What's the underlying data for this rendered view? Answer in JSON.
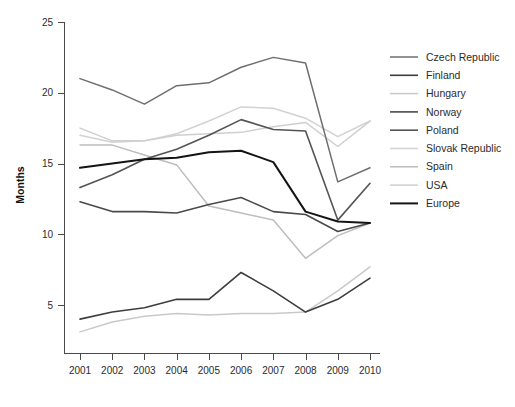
{
  "chart_data": {
    "type": "line",
    "title": "",
    "xlabel": "",
    "ylabel": "Months",
    "x": [
      2001,
      2002,
      2003,
      2004,
      2005,
      2006,
      2007,
      2008,
      2009,
      2010
    ],
    "xtick_labels": [
      "2001",
      "2002",
      "2003",
      "2004",
      "2005",
      "2006",
      "2007",
      "2008",
      "2009",
      "2010"
    ],
    "ytick_labels": [
      "5",
      "10",
      "15",
      "20",
      "25"
    ],
    "yticks": [
      5,
      10,
      15,
      20,
      25
    ],
    "ylim": [
      2.2,
      25
    ],
    "xlim": [
      2001,
      2010
    ],
    "grid": false,
    "legend_position": "right",
    "series": [
      {
        "name": "Czech Republic",
        "color": "#6e6e6e",
        "width": 1.5,
        "values": [
          21.0,
          20.2,
          19.2,
          20.5,
          20.7,
          21.8,
          22.5,
          22.1,
          13.7,
          14.7
        ]
      },
      {
        "name": "Finland",
        "color": "#3d3d3d",
        "width": 1.6,
        "values": [
          4.0,
          4.5,
          4.8,
          5.4,
          5.4,
          7.3,
          6.0,
          4.5,
          5.4,
          6.9
        ]
      },
      {
        "name": "Hungary",
        "color": "#c9c9c9",
        "width": 1.5,
        "values": [
          3.1,
          3.8,
          4.2,
          4.4,
          4.3,
          4.4,
          4.4,
          4.5,
          6.0,
          7.7
        ]
      },
      {
        "name": "Norway",
        "color": "#4a4a4a",
        "width": 1.6,
        "values": [
          12.3,
          11.6,
          11.6,
          11.5,
          12.1,
          12.6,
          11.6,
          11.4,
          10.2,
          10.8
        ]
      },
      {
        "name": "Poland",
        "color": "#545454",
        "width": 1.6,
        "values": [
          13.3,
          14.2,
          15.3,
          16.0,
          17.0,
          18.1,
          17.4,
          17.3,
          11.0,
          13.6
        ]
      },
      {
        "name": "Slovak Republic",
        "color": "#d2d2d2",
        "width": 1.5,
        "values": [
          17.0,
          16.5,
          16.6,
          17.1,
          18.0,
          19.0,
          18.9,
          18.2,
          16.9,
          18.0
        ]
      },
      {
        "name": "Spain",
        "color": "#bdbdbd",
        "width": 1.5,
        "values": [
          16.3,
          16.3,
          15.6,
          14.9,
          12.0,
          11.5,
          11.0,
          8.3,
          9.9,
          10.8
        ]
      },
      {
        "name": "USA",
        "color": "#cfcfcf",
        "width": 1.5,
        "values": [
          17.5,
          16.6,
          16.6,
          17.0,
          17.1,
          17.2,
          17.6,
          17.9,
          16.2,
          18.0
        ]
      },
      {
        "name": "Europe",
        "color": "#141414",
        "width": 2.0,
        "values": [
          14.7,
          15.0,
          15.3,
          15.4,
          15.8,
          15.9,
          15.1,
          11.6,
          10.9,
          10.8
        ]
      }
    ]
  },
  "axis": {
    "y_title": "Months"
  }
}
